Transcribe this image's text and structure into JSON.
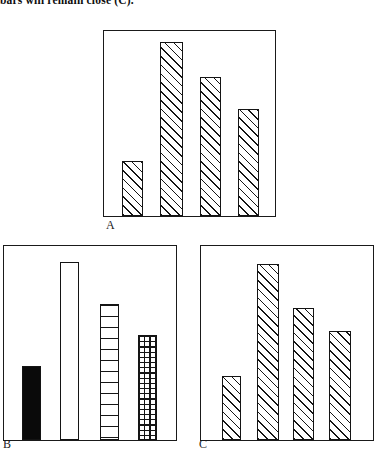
{
  "caption": {
    "text": "bars will remain close (C)."
  },
  "figure": {
    "panels": [
      {
        "id": "A",
        "label": "A",
        "fill_style": "diagonal-hatch",
        "bars": [
          {
            "name": "bar-a-1",
            "value": 30,
            "fill": "diagonal-hatch"
          },
          {
            "name": "bar-a-2",
            "value": 94,
            "fill": "diagonal-hatch"
          },
          {
            "name": "bar-a-3",
            "value": 75,
            "fill": "diagonal-hatch"
          },
          {
            "name": "bar-a-4",
            "value": 58,
            "fill": "diagonal-hatch"
          }
        ]
      },
      {
        "id": "B",
        "label": "B",
        "fill_style": "mixed",
        "bars": [
          {
            "name": "bar-b-1",
            "value": 38,
            "fill": "solid-black"
          },
          {
            "name": "bar-b-2",
            "value": 92,
            "fill": "empty-white"
          },
          {
            "name": "bar-b-3",
            "value": 70,
            "fill": "horizontal-stripes"
          },
          {
            "name": "bar-b-4",
            "value": 54,
            "fill": "cross-hatch-grid"
          }
        ]
      },
      {
        "id": "C",
        "label": "C",
        "fill_style": "diagonal-hatch",
        "bars": [
          {
            "name": "bar-c-1",
            "value": 33,
            "fill": "diagonal-hatch"
          },
          {
            "name": "bar-c-2",
            "value": 91,
            "fill": "diagonal-hatch"
          },
          {
            "name": "bar-c-3",
            "value": 68,
            "fill": "diagonal-hatch"
          },
          {
            "name": "bar-c-4",
            "value": 56,
            "fill": "diagonal-hatch"
          }
        ]
      }
    ]
  },
  "chart_data": {
    "type": "bar",
    "title": "",
    "xlabel": "",
    "ylabel": "",
    "ylim": [
      0,
      100
    ],
    "grid": false,
    "legend": "none",
    "panels": [
      {
        "panel": "A",
        "categories": [
          "1",
          "2",
          "3",
          "4"
        ],
        "values": [
          30,
          94,
          75,
          58
        ],
        "fills": [
          "diagonal-hatch",
          "diagonal-hatch",
          "diagonal-hatch",
          "diagonal-hatch"
        ]
      },
      {
        "panel": "B",
        "categories": [
          "1",
          "2",
          "3",
          "4"
        ],
        "values": [
          38,
          92,
          70,
          54
        ],
        "fills": [
          "solid-black",
          "empty-white",
          "horizontal-stripes",
          "cross-hatch-grid"
        ]
      },
      {
        "panel": "C",
        "categories": [
          "1",
          "2",
          "3",
          "4"
        ],
        "values": [
          33,
          91,
          68,
          56
        ],
        "fills": [
          "diagonal-hatch",
          "diagonal-hatch",
          "diagonal-hatch",
          "diagonal-hatch"
        ]
      }
    ]
  }
}
